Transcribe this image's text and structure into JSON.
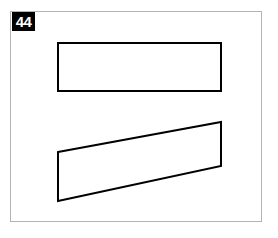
{
  "canvas": {
    "width": 278,
    "height": 238,
    "background_color": "#ffffff"
  },
  "frame": {
    "label": "image-border",
    "color": "#b3b3b3",
    "stroke_width": 1,
    "x": 10,
    "y": 11,
    "width": 252,
    "height": 211
  },
  "badge": {
    "text": "44",
    "text_color": "#ffffff",
    "background_color": "#000000",
    "x": 12,
    "y": 12,
    "width": 23,
    "height": 19
  },
  "shapes": [
    {
      "name": "top-rectangle",
      "type": "rectangle",
      "stroke_color": "#000000",
      "fill_color": "#ffffff",
      "stroke_width": 2,
      "points": "58,43 221,43 221,91 58,91",
      "x": 58,
      "y": 43,
      "width": 163,
      "height": 48
    },
    {
      "name": "bottom-parallelogram",
      "type": "parallelogram",
      "stroke_color": "#000000",
      "fill_color": "#ffffff",
      "stroke_width": 2,
      "points": "58,152 221,122 221,166 58,201"
    }
  ]
}
